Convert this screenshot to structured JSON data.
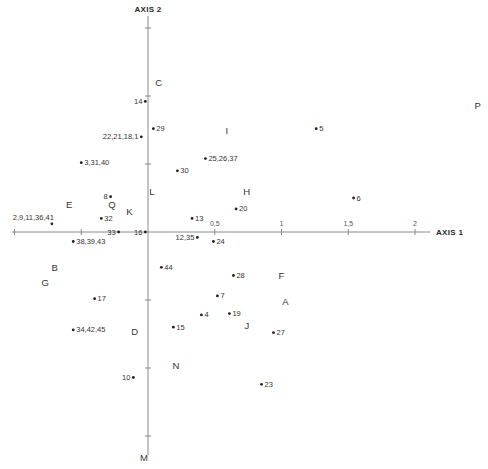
{
  "chart_data": {
    "type": "scatter",
    "title": "",
    "xlabel": "AXIS 1",
    "ylabel": "AXIS 2",
    "xlim": [
      -1.0,
      2.0
    ],
    "ylim": [
      -1.5,
      1.5
    ],
    "grid": false,
    "x_tick_labels": [
      {
        "value": 0.5,
        "label": "0,5"
      },
      {
        "value": 1.0,
        "label": "1"
      },
      {
        "value": 1.5,
        "label": "1,5"
      },
      {
        "value": 2.0,
        "label": "2"
      }
    ],
    "x_ticks_unlabeled": [
      -1.0,
      -0.5
    ],
    "y_ticks_unlabeled": [
      1.5,
      1.0,
      0.5,
      -0.5,
      -1.0,
      -1.5
    ],
    "series": [
      {
        "name": "observations",
        "marker": "dot",
        "points": [
          {
            "label": "14",
            "x": -0.02,
            "y": 0.96,
            "label_side": "left"
          },
          {
            "label": "29",
            "x": 0.04,
            "y": 0.76,
            "label_side": "right"
          },
          {
            "label": "22,21,18,1",
            "x": -0.05,
            "y": 0.7,
            "label_side": "left"
          },
          {
            "label": "3,31,40",
            "x": -0.5,
            "y": 0.51,
            "label_side": "right"
          },
          {
            "label": "30",
            "x": 0.22,
            "y": 0.45,
            "label_side": "right"
          },
          {
            "label": "25,26,37",
            "x": 0.43,
            "y": 0.54,
            "label_side": "right"
          },
          {
            "label": "5",
            "x": 1.26,
            "y": 0.76,
            "label_side": "right"
          },
          {
            "label": "6",
            "x": 1.54,
            "y": 0.25,
            "label_side": "right"
          },
          {
            "label": "8",
            "x": -0.28,
            "y": 0.26,
            "label_side": "left"
          },
          {
            "label": "32",
            "x": -0.35,
            "y": 0.1,
            "label_side": "right"
          },
          {
            "label": "2,9,11,36,41",
            "x": -0.72,
            "y": 0.06,
            "label_side": "above-left"
          },
          {
            "label": "33",
            "x": -0.22,
            "y": 0.0,
            "label_side": "left"
          },
          {
            "label": "16",
            "x": -0.02,
            "y": 0.0,
            "label_side": "left"
          },
          {
            "label": "13",
            "x": 0.33,
            "y": 0.1,
            "label_side": "right"
          },
          {
            "label": "20",
            "x": 0.66,
            "y": 0.17,
            "label_side": "right"
          },
          {
            "label": "12,35",
            "x": 0.37,
            "y": -0.04,
            "label_side": "left"
          },
          {
            "label": "24",
            "x": 0.49,
            "y": -0.07,
            "label_side": "right"
          },
          {
            "label": "38,39,43",
            "x": -0.56,
            "y": -0.07,
            "label_side": "right"
          },
          {
            "label": "44",
            "x": 0.1,
            "y": -0.26,
            "label_side": "right"
          },
          {
            "label": "28",
            "x": 0.64,
            "y": -0.32,
            "label_side": "right"
          },
          {
            "label": "17",
            "x": -0.4,
            "y": -0.49,
            "label_side": "right"
          },
          {
            "label": "7",
            "x": 0.52,
            "y": -0.47,
            "label_side": "right"
          },
          {
            "label": "4",
            "x": 0.4,
            "y": -0.61,
            "label_side": "right"
          },
          {
            "label": "19",
            "x": 0.61,
            "y": -0.6,
            "label_side": "right"
          },
          {
            "label": "15",
            "x": 0.19,
            "y": -0.7,
            "label_side": "right"
          },
          {
            "label": "34,42,45",
            "x": -0.56,
            "y": -0.72,
            "label_side": "right"
          },
          {
            "label": "27",
            "x": 0.94,
            "y": -0.74,
            "label_side": "right"
          },
          {
            "label": "10",
            "x": -0.11,
            "y": -1.07,
            "label_side": "left"
          },
          {
            "label": "23",
            "x": 0.85,
            "y": -1.12,
            "label_side": "right"
          }
        ]
      },
      {
        "name": "categories",
        "marker": "letter",
        "points": [
          {
            "label": "C",
            "x": 0.08,
            "y": 1.1
          },
          {
            "label": "P",
            "x": 2.47,
            "y": 0.93
          },
          {
            "label": "I",
            "x": 0.59,
            "y": 0.75
          },
          {
            "label": "H",
            "x": 0.74,
            "y": 0.3
          },
          {
            "label": "L",
            "x": 0.03,
            "y": 0.3
          },
          {
            "label": "E",
            "x": -0.59,
            "y": 0.2
          },
          {
            "label": "Q",
            "x": -0.27,
            "y": 0.2
          },
          {
            "label": "K",
            "x": -0.14,
            "y": 0.15
          },
          {
            "label": "B",
            "x": -0.7,
            "y": -0.26
          },
          {
            "label": "G",
            "x": -0.77,
            "y": -0.37
          },
          {
            "label": "F",
            "x": 1.0,
            "y": -0.32
          },
          {
            "label": "A",
            "x": 1.03,
            "y": -0.51
          },
          {
            "label": "J",
            "x": 0.74,
            "y": -0.69
          },
          {
            "label": "D",
            "x": -0.1,
            "y": -0.73
          },
          {
            "label": "N",
            "x": 0.21,
            "y": -0.98
          },
          {
            "label": "M",
            "x": -0.03,
            "y": -1.66
          }
        ]
      }
    ]
  },
  "layout": {
    "origin_px": [
      148,
      232
    ],
    "x_px_per_unit": 133.5,
    "y_px_per_unit": 136,
    "x_axis_px": [
      12,
      430
    ],
    "y_axis_px": [
      16,
      455
    ]
  },
  "colors": {
    "axis": "#8a8a8a",
    "text": "#2a2a2a",
    "dot": "#222222",
    "background": "#ffffff"
  }
}
